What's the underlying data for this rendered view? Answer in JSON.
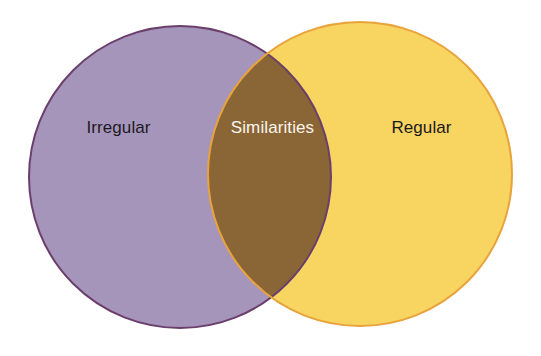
{
  "diagram": {
    "type": "venn",
    "background_color": "#ffffff",
    "width": 541,
    "height": 356,
    "left_set": {
      "label": "Irregular",
      "fill_color": "#a695bb",
      "stroke_color": "#6b3f6b",
      "text_color": "#1d1a1f",
      "center_x": 180,
      "center_y": 177,
      "radius": 151
    },
    "right_set": {
      "label": "Regular",
      "fill_color": "#f7d560",
      "stroke_color": "#e8a33d",
      "text_color": "#1d1a1f",
      "center_x": 360,
      "center_y": 174,
      "radius": 152
    },
    "intersection": {
      "label": "Similarities",
      "fill_color": "#8a6535",
      "text_color": "#fbf6ef",
      "top_point_x": 272,
      "top_point_y": 57,
      "bottom_point_x": 273,
      "bottom_point_y": 297
    }
  }
}
